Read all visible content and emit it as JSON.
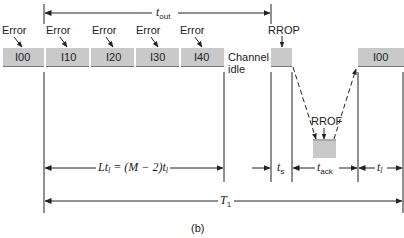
{
  "diagram": {
    "caption": "(b)",
    "frames": [
      {
        "id": "I00",
        "label": "I00",
        "error_label": "Error"
      },
      {
        "id": "I10",
        "label": "I10",
        "error_label": "Error"
      },
      {
        "id": "I20",
        "label": "I20",
        "error_label": "Error"
      },
      {
        "id": "I30",
        "label": "I30",
        "error_label": "Error"
      },
      {
        "id": "I40",
        "label": "I40",
        "error_label": "Error"
      }
    ],
    "channel_idle": {
      "line1": "Channel",
      "line2": "idle"
    },
    "rrop_label": "RROP",
    "rrof_label": "RROF",
    "retransmit_frame": "I00",
    "timing": {
      "t_out": {
        "base": "t",
        "sub": "out"
      },
      "lt": {
        "text_a": "Lt",
        "sub_a": "l",
        "text_eq": " = (M − 2)t",
        "sub_b": "l"
      },
      "t_s": {
        "base": "t",
        "sub": "s"
      },
      "t_ack": {
        "base": "t",
        "sub": "ack"
      },
      "t_l": {
        "base": "t",
        "sub": "l"
      },
      "T1": {
        "base": "T",
        "sub": "1"
      }
    }
  }
}
